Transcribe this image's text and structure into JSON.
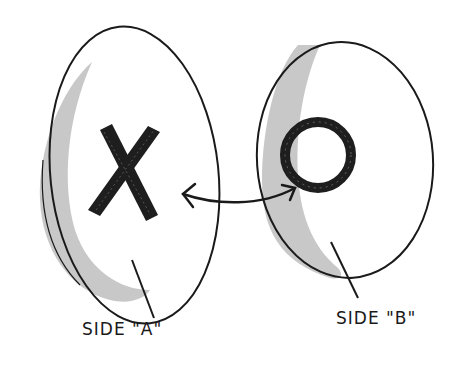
{
  "figure": {
    "side_a": {
      "symbol": "X",
      "label": "SIDE \"A\""
    },
    "side_b": {
      "symbol": "O",
      "label": "SIDE \"B\""
    },
    "connector": "double-headed-arrow",
    "colors": {
      "ink": "#1a1a1a",
      "shade": "#bdbdbd",
      "paper": "#ffffff"
    }
  }
}
